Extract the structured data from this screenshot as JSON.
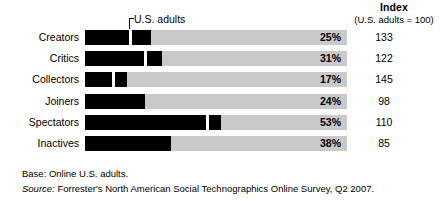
{
  "index_header": {
    "title": "Index",
    "subtitle": "(U.S. adults = 100)"
  },
  "annotation": {
    "label": "U.S. adults"
  },
  "footnotes": {
    "base_label": "Base:",
    "base_text": "Online U.S. adults.",
    "base_full": "Base: Online U.S. adults.",
    "source_label": "Source:",
    "source_text": "Forrester's North American Social Technographics Online Survey, Q2 2007."
  },
  "colors": {
    "bar_fill": "#000000",
    "track": "#c9c9c9",
    "gap": "#ffffff",
    "text": "#000000",
    "background": "#ffffff"
  },
  "chart_data": {
    "type": "bar",
    "orientation": "horizontal",
    "title": "",
    "subtitle": "",
    "xlabel": "",
    "ylabel": "",
    "xlim": [
      0,
      100
    ],
    "grid": false,
    "legend": null,
    "annotations": [
      {
        "text": "U.S. adults",
        "x": 17,
        "type": "pointer-line"
      }
    ],
    "categories": [
      "Creators",
      "Critics",
      "Collectors",
      "Joiners",
      "Spectators",
      "Inactives"
    ],
    "series": [
      {
        "name": "Percent of online U.S. adults",
        "values": [
          25,
          31,
          17,
          24,
          53,
          38
        ]
      },
      {
        "name": "Index (U.S. adults = 100)",
        "values": [
          133,
          122,
          145,
          98,
          110,
          85
        ]
      }
    ],
    "value_labels": [
      "25%",
      "31%",
      "17%",
      "24%",
      "53%",
      "38%"
    ],
    "index_labels": [
      "133",
      "122",
      "145",
      "98",
      "110",
      "85"
    ]
  },
  "rows": [
    {
      "label": "Creators",
      "pct": "25%",
      "index": "133",
      "bar": {
        "main_w": 44,
        "gap_x": 44,
        "gap_w": 3,
        "extra_x": 47,
        "extra_w": 19
      }
    },
    {
      "label": "Critics",
      "pct": "31%",
      "index": "122",
      "bar": {
        "main_w": 59,
        "gap_x": 59,
        "gap_w": 3,
        "extra_x": 62,
        "extra_w": 15
      }
    },
    {
      "label": "Collectors",
      "pct": "17%",
      "index": "145",
      "bar": {
        "main_w": 27,
        "gap_x": 27,
        "gap_w": 3,
        "extra_x": 30,
        "extra_w": 12
      }
    },
    {
      "label": "Joiners",
      "pct": "24%",
      "index": "98",
      "bar": {
        "main_w": 60,
        "gap_x": 60,
        "gap_w": 0,
        "extra_x": 0,
        "extra_w": 0
      }
    },
    {
      "label": "Spectators",
      "pct": "53%",
      "index": "110",
      "bar": {
        "main_w": 121,
        "gap_x": 121,
        "gap_w": 3,
        "extra_x": 124,
        "extra_w": 12
      }
    },
    {
      "label": "Inactives",
      "pct": "38%",
      "index": "85",
      "bar": {
        "main_w": 86,
        "gap_x": 86,
        "gap_w": 0,
        "extra_x": 0,
        "extra_w": 0
      }
    }
  ],
  "row_tops": [
    30,
    51,
    72,
    94,
    115,
    136
  ]
}
